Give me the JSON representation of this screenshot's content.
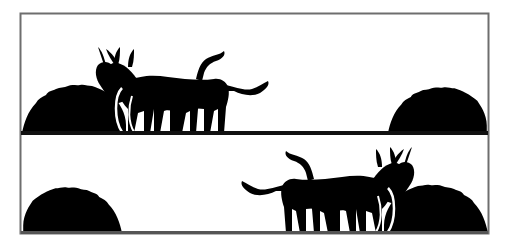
{
  "figure": {
    "panels": [
      {
        "id": "top",
        "donkeys_position": "left",
        "donkeys_facing": "left"
      },
      {
        "id": "bottom",
        "donkeys_position": "right",
        "donkeys_facing": "right"
      }
    ],
    "colors": {
      "background": "#ffffff",
      "silhouette": "#000000",
      "frame": "#6e6e6e"
    }
  }
}
